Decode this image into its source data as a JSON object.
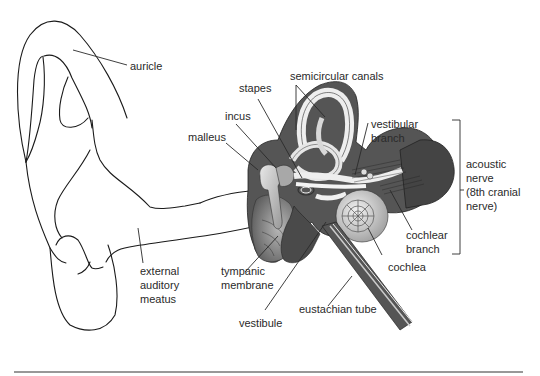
{
  "diagram": {
    "labels": {
      "auricle": "auricle",
      "semicircular_canals": "semicircular canals",
      "stapes": "stapes",
      "incus": "incus",
      "malleus": "malleus",
      "vestibular_branch_1": "vestibular",
      "vestibular_branch_2": "branch",
      "acoustic_nerve_1": "acoustic",
      "acoustic_nerve_2": "nerve",
      "acoustic_nerve_3": "(8th cranial",
      "acoustic_nerve_4": "nerve)",
      "cochlear_branch_1": "cochlear",
      "cochlear_branch_2": "branch",
      "cochlea": "cochlea",
      "external_auditory_meatus_1": "external",
      "external_auditory_meatus_2": "auditory",
      "external_auditory_meatus_3": "meatus",
      "tympanic_membrane_1": "tympanic",
      "tympanic_membrane_2": "membrane",
      "vestibule": "vestibule",
      "eustachian_tube": "eustachian tube"
    },
    "colors": {
      "outline": "#1a1a1a",
      "dark_tissue": "#4a4a4a",
      "mid_tissue": "#8a8a8a",
      "light_tissue": "#cfcfcf",
      "text": "#2a2a2a"
    }
  }
}
